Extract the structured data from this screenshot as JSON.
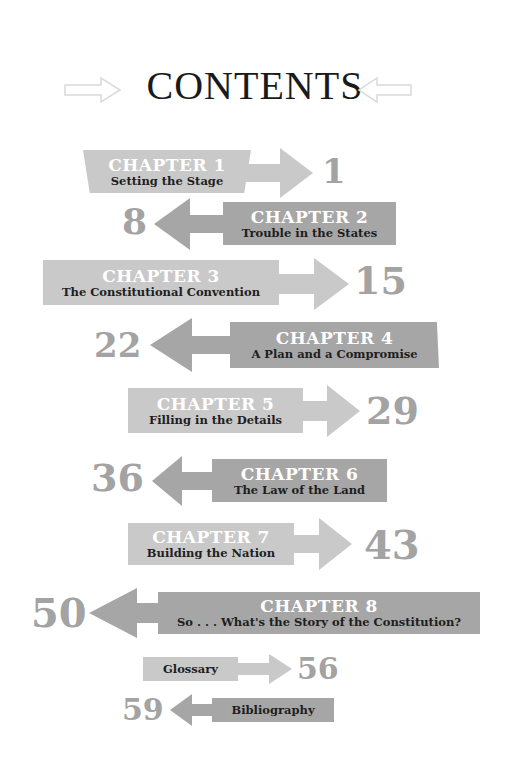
{
  "title": "CONTENTS",
  "colors": {
    "light_banner": "#c9c9c9",
    "dark_banner": "#a6a6a6",
    "page_number": "#a3a3a3",
    "title_text": "#1a1a1a",
    "header_arrow_outline": "#d9d9d9"
  },
  "header_icons": {
    "left": "right-pointing-hollow-arrow",
    "right": "left-pointing-hollow-arrow"
  },
  "entries": [
    {
      "chapter": "CHAPTER 1",
      "title": "Setting the Stage",
      "page": "1",
      "direction": "right"
    },
    {
      "chapter": "CHAPTER 2",
      "title": "Trouble in the States",
      "page": "8",
      "direction": "left"
    },
    {
      "chapter": "CHAPTER 3",
      "title": "The Constitutional Convention",
      "page": "15",
      "direction": "right"
    },
    {
      "chapter": "CHAPTER 4",
      "title": "A Plan and a Compromise",
      "page": "22",
      "direction": "left"
    },
    {
      "chapter": "CHAPTER 5",
      "title": "Filling in the Details",
      "page": "29",
      "direction": "right"
    },
    {
      "chapter": "CHAPTER 6",
      "title": "The Law of the Land",
      "page": "36",
      "direction": "left"
    },
    {
      "chapter": "CHAPTER 7",
      "title": "Building the Nation",
      "page": "43",
      "direction": "right"
    },
    {
      "chapter": "CHAPTER 8",
      "title": "So . . . What's the Story of the Constitution?",
      "page": "50",
      "direction": "left"
    }
  ],
  "back_matter": [
    {
      "title": "Glossary",
      "page": "56",
      "direction": "right"
    },
    {
      "title": "Bibliography",
      "page": "59",
      "direction": "left"
    }
  ]
}
